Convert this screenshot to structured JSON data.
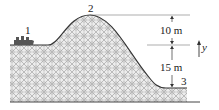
{
  "diagram": {
    "points": [
      {
        "id": "1",
        "label": "1",
        "description": "Starting plateau with car"
      },
      {
        "id": "2",
        "label": "2",
        "description": "Top of hill"
      },
      {
        "id": "3",
        "label": "3",
        "description": "Bottom of track"
      }
    ],
    "dimensions": [
      {
        "label": "10 m",
        "from": "2",
        "to": "1"
      },
      {
        "label": "15 m",
        "from": "1",
        "to": "3"
      }
    ],
    "axis": {
      "label": "y",
      "direction": "up"
    },
    "colors": {
      "line": "#333333",
      "hatch": "#9a9a9a",
      "fill": "#e6e6e6",
      "car": "#555555"
    }
  }
}
